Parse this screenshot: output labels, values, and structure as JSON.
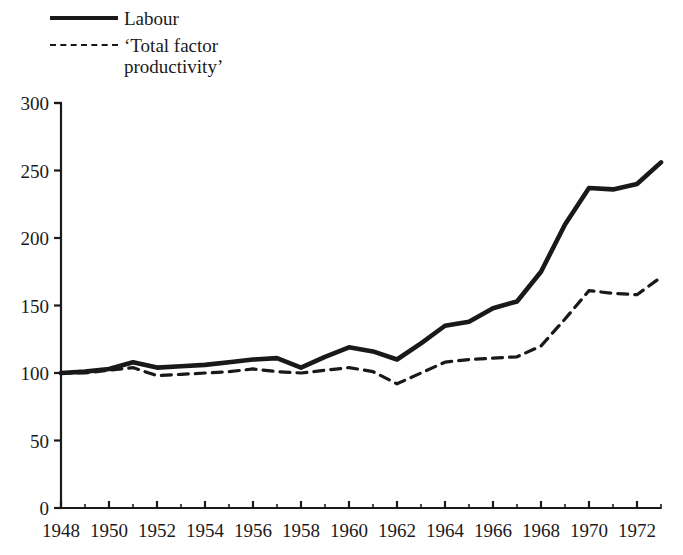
{
  "legend": {
    "position": "top-left",
    "entries": [
      {
        "label": "Labour",
        "style": "solid",
        "icon": "solid-line-swatch"
      },
      {
        "label": "‘Total factor\nproductivity’",
        "style": "dashed",
        "icon": "dashed-line-swatch"
      }
    ]
  },
  "axes": {
    "y_ticks": [
      "0",
      "50",
      "100",
      "150",
      "200",
      "250",
      "300"
    ],
    "x_ticks": [
      "1948",
      "1950",
      "1952",
      "1954",
      "1956",
      "1958",
      "1960",
      "1962",
      "1964",
      "1966",
      "1968",
      "1970",
      "1972"
    ]
  },
  "colors": {
    "line": "#191919",
    "axis": "#1a1a1a",
    "background": "#ffffff"
  },
  "chart_data": {
    "type": "line",
    "title": "",
    "subtitle": "",
    "xlabel": "",
    "ylabel": "",
    "xlim": [
      1948,
      1973
    ],
    "ylim": [
      0,
      300
    ],
    "grid": false,
    "legend_position": "top-left",
    "x": [
      1948,
      1949,
      1950,
      1951,
      1952,
      1953,
      1954,
      1955,
      1956,
      1957,
      1958,
      1959,
      1960,
      1961,
      1962,
      1963,
      1964,
      1965,
      1966,
      1967,
      1968,
      1969,
      1970,
      1971,
      1972,
      1973
    ],
    "series": [
      {
        "name": "Labour",
        "style": "solid",
        "values": [
          100,
          101,
          103,
          108,
          104,
          105,
          106,
          108,
          110,
          111,
          104,
          112,
          119,
          116,
          110,
          122,
          135,
          138,
          148,
          153,
          175,
          210,
          237,
          236,
          240,
          256
        ]
      },
      {
        "name": "‘Total factor productivity’",
        "style": "dashed",
        "values": [
          100,
          100,
          102,
          104,
          98,
          99,
          100,
          101,
          103,
          101,
          100,
          102,
          104,
          101,
          92,
          100,
          108,
          110,
          111,
          112,
          120,
          140,
          161,
          159,
          158,
          171
        ]
      }
    ]
  }
}
